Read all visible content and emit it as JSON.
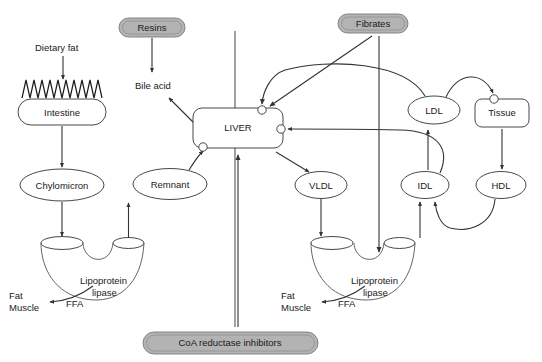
{
  "diagram": {
    "canvas": {
      "width": 542,
      "height": 362
    },
    "background_color": "#ffffff",
    "line_color": "#333333",
    "drug_fill_color": "#b3b3b3",
    "node_fill_color": "#ffffff"
  },
  "drugs": [
    {
      "id": "resins",
      "label": "Resins",
      "x": 152,
      "y": 27,
      "w": 66,
      "h": 19
    },
    {
      "id": "fibrates",
      "label": "Fibrates",
      "x": 373,
      "y": 23,
      "w": 70,
      "h": 19
    },
    {
      "id": "coa",
      "label": "CoA reductase inhibitors",
      "x": 230,
      "y": 343,
      "w": 175,
      "h": 22
    }
  ],
  "nodes": [
    {
      "id": "intestine",
      "label": "Intestine",
      "shape": "rounded-rect",
      "x": 62,
      "y": 112,
      "w": 88,
      "h": 26
    },
    {
      "id": "chylomicron",
      "label": "Chylomicron",
      "shape": "ellipse",
      "x": 62,
      "y": 185,
      "w": 84,
      "h": 32
    },
    {
      "id": "remnant",
      "label": "Remnant",
      "shape": "ellipse",
      "x": 170,
      "y": 184,
      "w": 74,
      "h": 31
    },
    {
      "id": "liver",
      "label": "LIVER",
      "shape": "rounded-rect",
      "x": 238,
      "y": 128,
      "w": 90,
      "h": 40
    },
    {
      "id": "vldl",
      "label": "VLDL",
      "shape": "ellipse",
      "x": 321,
      "y": 185,
      "w": 52,
      "h": 27
    },
    {
      "id": "idl",
      "label": "IDL",
      "shape": "ellipse",
      "x": 425,
      "y": 185,
      "w": 48,
      "h": 27
    },
    {
      "id": "ldl",
      "label": "LDL",
      "shape": "ellipse",
      "x": 434,
      "y": 110,
      "w": 52,
      "h": 28
    },
    {
      "id": "hdl",
      "label": "HDL",
      "shape": "ellipse",
      "x": 501,
      "y": 185,
      "w": 50,
      "h": 27
    },
    {
      "id": "tissue",
      "label": "Tissue",
      "shape": "rounded-rect",
      "x": 502,
      "y": 113,
      "w": 54,
      "h": 28
    }
  ],
  "plain_labels": [
    {
      "id": "dietary-fat",
      "label": "Dietary fat",
      "x": 63,
      "y": 48
    },
    {
      "id": "bile-acid",
      "label": "Bile acid",
      "x": 158,
      "y": 86
    },
    {
      "id": "lpl-left-line1",
      "label": "Lipoprotein",
      "x": 108,
      "y": 281
    },
    {
      "id": "lpl-left-line2",
      "label": "lipase",
      "x": 108,
      "y": 293
    },
    {
      "id": "ffa-left",
      "label": "FFA",
      "x": 80,
      "y": 304
    },
    {
      "id": "fat-left",
      "label": "Fat",
      "x": 22,
      "y": 296
    },
    {
      "id": "muscle-left",
      "label": "Muscle",
      "x": 31,
      "y": 308
    },
    {
      "id": "lpl-right-line1",
      "label": "Lipoprotein",
      "x": 380,
      "y": 281
    },
    {
      "id": "lpl-right-line2",
      "label": "lipase",
      "x": 380,
      "y": 293
    },
    {
      "id": "ffa-right",
      "label": "FFA",
      "x": 352,
      "y": 304
    },
    {
      "id": "fat-right",
      "label": "Fat",
      "x": 294,
      "y": 296
    },
    {
      "id": "muscle-right",
      "label": "Muscle",
      "x": 303,
      "y": 308
    }
  ],
  "receptors": [
    {
      "id": "liver-receptor-top",
      "x": 262,
      "y": 110
    },
    {
      "id": "liver-receptor-right",
      "x": 277,
      "y": 129
    },
    {
      "id": "liver-receptor-bottom-left",
      "x": 203,
      "y": 148
    },
    {
      "id": "tissue-receptor-top",
      "x": 495,
      "y": 100
    }
  ],
  "edges": [
    {
      "id": "dietary-fat-to-intestine",
      "from": "dietary-fat",
      "to": "intestine"
    },
    {
      "id": "resins-to-bile-acid",
      "from": "resins",
      "to": "bile-acid"
    },
    {
      "id": "liver-to-bile-acid",
      "from": "liver",
      "to": "bile-acid"
    },
    {
      "id": "intestine-to-chylomicron",
      "from": "intestine",
      "to": "chylomicron"
    },
    {
      "id": "chylomicron-to-lpl-left",
      "from": "chylomicron",
      "to": "lipoprotein-lipase-left"
    },
    {
      "id": "lpl-left-to-remnant",
      "from": "lipoprotein-lipase-left",
      "to": "remnant"
    },
    {
      "id": "lpl-left-to-fat-muscle",
      "from": "lipoprotein-lipase-left",
      "to": "fat-muscle-left"
    },
    {
      "id": "remnant-to-liver",
      "from": "remnant",
      "to": "liver-receptor-bottom-left"
    },
    {
      "id": "liver-to-vldl",
      "from": "liver",
      "to": "vldl"
    },
    {
      "id": "vldl-to-lpl-right",
      "from": "vldl",
      "to": "lipoprotein-lipase-right"
    },
    {
      "id": "lpl-right-to-idl",
      "from": "lipoprotein-lipase-right",
      "to": "idl"
    },
    {
      "id": "lpl-right-to-fat-muscle",
      "from": "lipoprotein-lipase-right",
      "to": "fat-muscle-right"
    },
    {
      "id": "idl-to-ldl",
      "from": "idl",
      "to": "ldl"
    },
    {
      "id": "idl-to-liver",
      "from": "idl",
      "to": "liver-receptor-right"
    },
    {
      "id": "ldl-to-liver",
      "from": "ldl",
      "to": "liver-receptor-top"
    },
    {
      "id": "ldl-to-tissue",
      "from": "ldl",
      "to": "tissue-receptor-top"
    },
    {
      "id": "tissue-to-hdl",
      "from": "tissue",
      "to": "hdl"
    },
    {
      "id": "hdl-to-idl",
      "from": "hdl",
      "to": "idl"
    },
    {
      "id": "fibrates-to-liver",
      "from": "fibrates",
      "to": "liver-receptor-top"
    },
    {
      "id": "fibrates-to-lpl-right",
      "from": "fibrates",
      "to": "lipoprotein-lipase-right"
    },
    {
      "id": "coa-to-liver",
      "from": "coa",
      "to": "liver"
    }
  ]
}
